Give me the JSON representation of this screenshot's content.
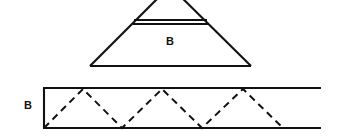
{
  "figure": {
    "background_color": "#ffffff",
    "line_color": "#111111",
    "canvas": {
      "width": 339,
      "height": 136
    },
    "top_shape": {
      "name": "truncated-triangle-pyramid",
      "label": "B",
      "label_position": {
        "x": 170,
        "y": 45
      },
      "label_font_size": 11,
      "description": "Large triangle with apex cropped at top of image, crossed by a pair of parallel horizontal lines near the top",
      "left_vertex": {
        "x": 90,
        "y": 66
      },
      "right_vertex": {
        "x": 251,
        "y": 66
      },
      "apex": {
        "x": 170,
        "y": -14
      },
      "base_y": 66,
      "cut_line_upper": {
        "x1": 134,
        "y1": 20,
        "x2": 207,
        "y2": 20
      },
      "cut_line_lower": {
        "x1": 133,
        "y1": 24,
        "x2": 208,
        "y2": 24
      },
      "stroke_width": 2.1
    },
    "bottom_shape": {
      "name": "unrolled-lateral-strip",
      "label": "B",
      "label_position": {
        "x": 28,
        "y": 109
      },
      "label_font_size": 11,
      "description": "Long horizontal strip (unrolled band) with dashed zigzag triangles inside",
      "left_edge_x": 43,
      "top_y": 88,
      "bottom_y": 128,
      "right_extent_x": 321,
      "stroke_width": 2.1,
      "zigzag": {
        "dash_pattern": "7 5",
        "stroke_width": 2.0,
        "points": [
          {
            "x": 44,
            "y": 128
          },
          {
            "x": 83,
            "y": 89
          },
          {
            "x": 122,
            "y": 128
          },
          {
            "x": 162,
            "y": 89
          },
          {
            "x": 202,
            "y": 128
          },
          {
            "x": 243,
            "y": 89
          },
          {
            "x": 283,
            "y": 128
          }
        ]
      }
    }
  }
}
